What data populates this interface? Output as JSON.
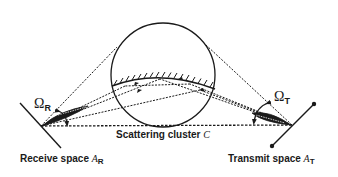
{
  "figure": {
    "type": "diagram",
    "colors": {
      "ink": "#1a1a1a",
      "background": "#ffffff"
    },
    "scattering_cluster": {
      "label_text": "Scattering cluster ",
      "label_symbol": "C"
    },
    "receive": {
      "label_text": "Receive space ",
      "label_symbol": "A",
      "label_sub": "R",
      "angle_symbol": "Ω",
      "angle_sub": "R"
    },
    "transmit": {
      "label_text": "Transmit space ",
      "label_symbol": "A",
      "label_sub": "T",
      "angle_symbol": "Ω",
      "angle_sub": "T"
    }
  }
}
